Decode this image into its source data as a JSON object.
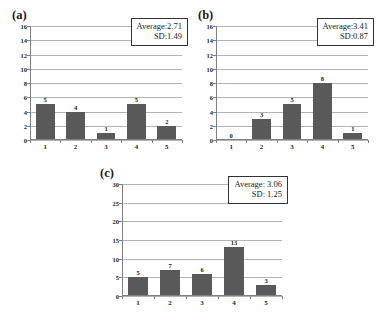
{
  "figure": {
    "panels": [
      {
        "id": "a",
        "label": "(a)",
        "stats": {
          "average_label": "Average:2.71",
          "sd_label": "SD:1.49"
        },
        "chart_data": {
          "type": "bar",
          "title": "",
          "xlabel": "",
          "ylabel": "",
          "categories": [
            "1",
            "2",
            "3",
            "4",
            "5"
          ],
          "values": [
            5,
            4,
            1,
            5,
            2
          ],
          "value_labels": [
            "5",
            "4",
            "1",
            "5",
            "2"
          ],
          "ylim": [
            0,
            16
          ],
          "yticks": [
            0,
            2,
            4,
            6,
            8,
            10,
            12,
            14,
            16
          ],
          "ytick_labels": [
            "0",
            "2",
            "4",
            "6",
            "8",
            "10",
            "12",
            "14",
            "16"
          ],
          "grid": true,
          "legend": "none",
          "annotations": [
            "Average:2.71",
            "SD:1.49"
          ],
          "average": 2.71,
          "sd": 1.49
        }
      },
      {
        "id": "b",
        "label": "(b)",
        "stats": {
          "average_label": "Average:3.41",
          "sd_label": "SD:0.87"
        },
        "chart_data": {
          "type": "bar",
          "title": "",
          "xlabel": "",
          "ylabel": "",
          "categories": [
            "1",
            "2",
            "3",
            "4",
            "5"
          ],
          "values": [
            0,
            3,
            5,
            8,
            1
          ],
          "value_labels": [
            "0",
            "3",
            "5",
            "8",
            "1"
          ],
          "ylim": [
            0,
            16
          ],
          "yticks": [
            0,
            2,
            4,
            6,
            8,
            10,
            12,
            14,
            16
          ],
          "ytick_labels": [
            "0",
            "2",
            "4",
            "6",
            "8",
            "10",
            "12",
            "14",
            "16"
          ],
          "grid": true,
          "legend": "none",
          "annotations": [
            "Average:3.41",
            "SD:0.87"
          ],
          "average": 3.41,
          "sd": 0.87
        }
      },
      {
        "id": "c",
        "label": "(c)",
        "stats": {
          "average_label": "Average:  3.06",
          "sd_label": "SD:  1.25"
        },
        "chart_data": {
          "type": "bar",
          "title": "",
          "xlabel": "",
          "ylabel": "",
          "categories": [
            "1",
            "2",
            "3",
            "4",
            "5"
          ],
          "values": [
            5,
            7,
            6,
            13,
            3
          ],
          "value_labels": [
            "5",
            "7",
            "6",
            "13",
            "3"
          ],
          "ylim": [
            0,
            30
          ],
          "yticks": [
            0,
            5,
            10,
            15,
            20,
            25,
            30
          ],
          "ytick_labels": [
            "0",
            "5",
            "10",
            "15",
            "20",
            "25",
            "30"
          ],
          "grid": true,
          "legend": "none",
          "annotations": [
            "Average:  3.06",
            "SD:  1.25"
          ],
          "average": 3.06,
          "sd": 1.25
        }
      }
    ],
    "colors": {
      "bar": "#595959",
      "gridline": "#b3b3b3",
      "axis": "#808080",
      "text": "#1a1a1a",
      "background": "#ffffff"
    }
  }
}
